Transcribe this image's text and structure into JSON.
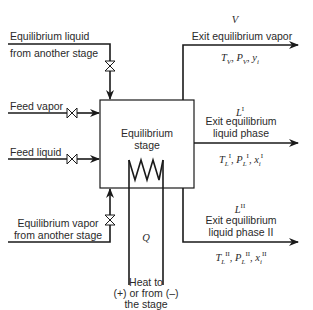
{
  "diagram": {
    "title": "Equilibrium stage",
    "stage": {
      "label_line1": "Equilibrium",
      "label_line2": "stage"
    },
    "inputs": {
      "liquid_from_stage": {
        "line1": "Equilibrium liquid",
        "line2": "from another stage"
      },
      "feed_vapor": "Feed vapor",
      "feed_liquid": "Feed liquid",
      "vapor_from_stage": {
        "line1": "Equilibrium vapor",
        "line2": "from another stage"
      }
    },
    "outputs": {
      "vapor": {
        "symbol": "V",
        "label": "Exit equilibrium vapor",
        "props": "T_V, P_V, y_i"
      },
      "liquid_I": {
        "symbol": "L",
        "symbol_sup": "I",
        "label_line1": "Exit equilibrium",
        "label_line2": "liquid phase",
        "props": "T_L^I, P_L^I, x_i^I"
      },
      "liquid_II": {
        "symbol": "L",
        "symbol_sup": "II",
        "label_line1": "Exit equilibrium",
        "label_line2": "liquid phase II",
        "props": "T_L^II, P_L^II, x_i^II"
      }
    },
    "heat": {
      "symbol": "Q",
      "line1": "Heat to",
      "line2": "(+) or from (–)",
      "line3": "the stage"
    },
    "colors": {
      "line": "#1a1a1a",
      "text": "#2a2a2a",
      "background": "#ffffff"
    }
  }
}
